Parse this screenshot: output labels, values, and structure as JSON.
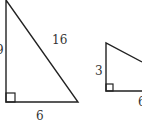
{
  "diagram": {
    "triangle_large": {
      "hypotenuse_label": "16",
      "base_label": "6",
      "leg_label_partial": "9"
    },
    "triangle_small": {
      "leg_label": "3",
      "base_label": "6"
    }
  }
}
